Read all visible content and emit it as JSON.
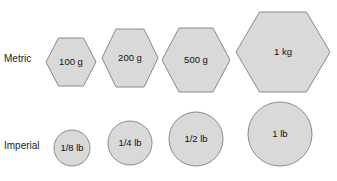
{
  "figure": {
    "background_color": "#ffffff",
    "shape_fill": "#d9d9d9",
    "shape_stroke": "#8a8a8a",
    "text_color": "#111111"
  },
  "rows": [
    {
      "label": "Metric",
      "label_x": 4,
      "label_y": 62,
      "shape_type": "hexagon",
      "baseline_y": 92,
      "items": [
        {
          "label": "100 g",
          "cx": 71,
          "cy": 62,
          "rx": 25,
          "ry": 24
        },
        {
          "label": "200 g",
          "cx": 130,
          "cy": 58,
          "rx": 28,
          "ry": 29
        },
        {
          "label": "500 g",
          "cx": 196,
          "cy": 60,
          "rx": 34,
          "ry": 32
        },
        {
          "label": "1 kg",
          "cx": 283,
          "cy": 52,
          "rx": 47,
          "ry": 40
        }
      ]
    },
    {
      "label": "Imperial",
      "label_x": 4,
      "label_y": 149,
      "shape_type": "circle",
      "baseline_y": 166,
      "items": [
        {
          "label": "1/8 lb",
          "cx": 72,
          "cy": 148,
          "rx": 18,
          "ry": 18
        },
        {
          "label": "1/4 lb",
          "cx": 130,
          "cy": 143,
          "rx": 22,
          "ry": 22
        },
        {
          "label": "1/2 lb",
          "cx": 196,
          "cy": 139,
          "rx": 27,
          "ry": 27
        },
        {
          "label": "1 lb",
          "cx": 280,
          "cy": 134,
          "rx": 32,
          "ry": 32
        }
      ]
    }
  ]
}
